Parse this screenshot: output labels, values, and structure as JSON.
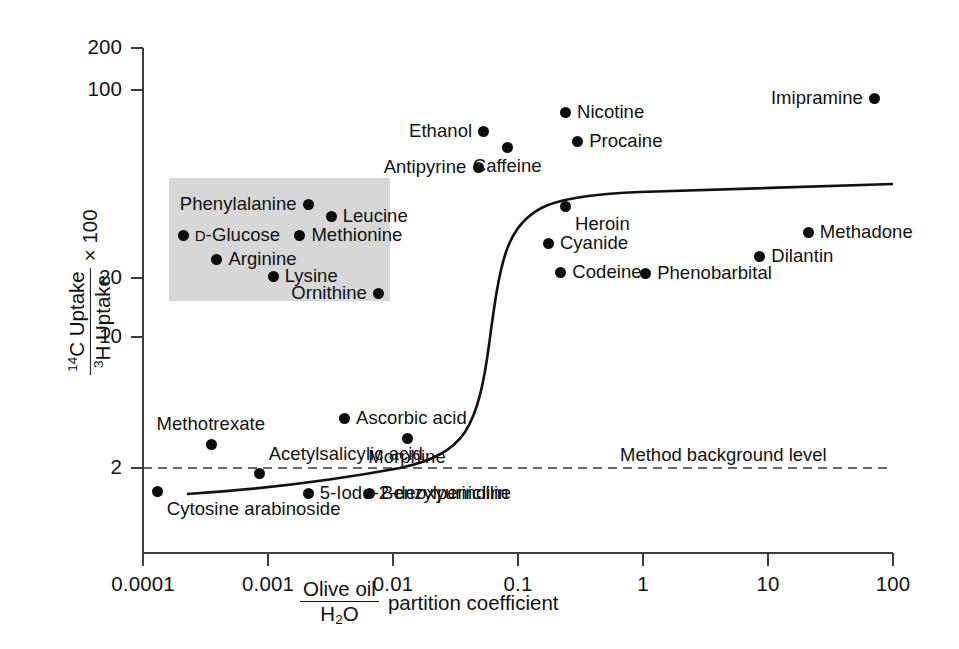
{
  "chart_data": {
    "type": "scatter",
    "title": "",
    "xlabel": "Olive oil / H2O partition coefficient",
    "ylabel": "14C Uptake / 3H Uptake x 100",
    "xscale": "log",
    "yscale": "log",
    "xlim": [
      0.0001,
      100
    ],
    "ylim": [
      1.3,
      200
    ],
    "grid": false,
    "legend": "none",
    "xticks": [
      "0.0001",
      "0.001",
      "0.01",
      "0.1",
      "1",
      "10",
      "100"
    ],
    "xtick_values": [
      0.0001,
      0.001,
      0.01,
      0.1,
      1,
      10,
      100
    ],
    "yticks": [
      "200",
      "100",
      "20",
      "10",
      "2"
    ],
    "ytick_values": [
      200,
      100,
      20,
      10,
      2
    ],
    "annotations": [
      {
        "text": "Method background level",
        "y": 2,
        "kind": "dashed-horizontal-line"
      }
    ],
    "shaded_region": {
      "note": "grey box enclosing carrier-mediated transport compounds",
      "x_range": [
        0.00016,
        0.0095
      ],
      "y_range": [
        12.5,
        48
      ]
    },
    "curve": {
      "name": "sigmoid fit",
      "style": "solid",
      "description": "low plateau near background rising sharply between 0.04 and 0.15 to a high plateau near 38"
    },
    "points": [
      {
        "label": "Cytosine arabinoside",
        "x": 0.00013,
        "y": 1.55,
        "label_pos": "below-right",
        "region": "outside"
      },
      {
        "label": "Methotrexate",
        "x": 0.00035,
        "y": 2.6,
        "label_pos": "above",
        "region": "outside"
      },
      {
        "label": "Acetylsalicylic acid",
        "x": 0.00085,
        "y": 1.88,
        "label_pos": "above-right",
        "region": "outside"
      },
      {
        "label": "5-Iodo-2-deoxyurindine",
        "x": 0.0021,
        "y": 1.52,
        "label_pos": "right",
        "region": "outside"
      },
      {
        "label": "Ascorbic acid",
        "x": 0.0041,
        "y": 3.45,
        "label_pos": "right",
        "region": "outside"
      },
      {
        "label": "Benzylpenicillin",
        "x": 0.0065,
        "y": 1.52,
        "label_pos": "right",
        "region": "outside"
      },
      {
        "label": "Morphine",
        "x": 0.013,
        "y": 2.75,
        "label_pos": "below",
        "region": "outside"
      },
      {
        "label": "D-Glucose",
        "x": 0.00021,
        "y": 25.5,
        "label_pos": "right",
        "region": "shaded"
      },
      {
        "label": "Arginine",
        "x": 0.00039,
        "y": 19.7,
        "label_pos": "right",
        "region": "shaded"
      },
      {
        "label": "Lysine",
        "x": 0.0011,
        "y": 16.3,
        "label_pos": "right",
        "region": "shaded"
      },
      {
        "label": "Methionine",
        "x": 0.0018,
        "y": 25.5,
        "label_pos": "right",
        "region": "shaded"
      },
      {
        "label": "Phenylalanine",
        "x": 0.0021,
        "y": 36.0,
        "label_pos": "left",
        "region": "shaded"
      },
      {
        "label": "Leucine",
        "x": 0.0032,
        "y": 31.5,
        "label_pos": "right",
        "region": "shaded"
      },
      {
        "label": "Ornithine",
        "x": 0.0077,
        "y": 13.6,
        "label_pos": "left",
        "region": "shaded"
      },
      {
        "label": "Antipyrine",
        "x": 0.048,
        "y": 54.0,
        "label_pos": "left",
        "region": "outside"
      },
      {
        "label": "Ethanol",
        "x": 0.053,
        "y": 80.0,
        "label_pos": "left",
        "region": "outside"
      },
      {
        "label": "Caffeine",
        "x": 0.082,
        "y": 67.0,
        "label_pos": "below",
        "region": "outside"
      },
      {
        "label": "Nicotine",
        "x": 0.24,
        "y": 99.0,
        "label_pos": "right",
        "region": "outside"
      },
      {
        "label": "Procaine",
        "x": 0.3,
        "y": 72.0,
        "label_pos": "right",
        "region": "outside"
      },
      {
        "label": "Heroin",
        "x": 0.24,
        "y": 35.0,
        "label_pos": "below-right",
        "region": "outside"
      },
      {
        "label": "Cyanide",
        "x": 0.175,
        "y": 23.5,
        "label_pos": "right",
        "region": "outside"
      },
      {
        "label": "Codeine",
        "x": 0.22,
        "y": 17.0,
        "label_pos": "right",
        "region": "outside"
      },
      {
        "label": "Phenobarbital",
        "x": 1.05,
        "y": 16.8,
        "label_pos": "right",
        "region": "outside"
      },
      {
        "label": "Dilantin",
        "x": 8.6,
        "y": 20.3,
        "label_pos": "right",
        "region": "outside"
      },
      {
        "label": "Methadone",
        "x": 21.0,
        "y": 26.5,
        "label_pos": "right",
        "region": "outside"
      },
      {
        "label": "Imipramine",
        "x": 71.0,
        "y": 115.0,
        "label_pos": "left",
        "region": "outside"
      }
    ]
  },
  "axis": {
    "x_title_numerator": "Olive oil",
    "x_title_denominator_pre": "H",
    "x_title_denominator_sub": "2",
    "x_title_denominator_post": "O",
    "x_title_suffix": "partition coefficient",
    "y_title_numerator_sup": "14",
    "y_title_numerator_text": "C Uptake",
    "y_title_denominator_sup": "3",
    "y_title_denominator_text": "H Uptake",
    "y_title_multiplier": "× 100"
  },
  "colors": {
    "axis": "#3d3d3d",
    "point": "#0c0c0c",
    "curve": "#111111",
    "shaded_box": "#d7d7d7",
    "background": "#ffffff",
    "text": "#111111"
  }
}
